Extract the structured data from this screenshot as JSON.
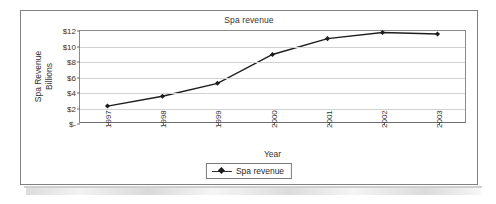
{
  "chart_data": {
    "type": "line",
    "title": "Spa revenue",
    "xlabel": "Year",
    "ylabel": "Spa Revenue Billions",
    "ylabel_lines": [
      "Spa Revenue",
      "Billions"
    ],
    "categories": [
      "1997",
      "1998",
      "1999",
      "2000",
      "2001",
      "2002",
      "2003"
    ],
    "series": [
      {
        "name": "Spa revenue",
        "values": [
          2.1,
          3.4,
          5.1,
          8.9,
          11.0,
          11.8,
          11.6
        ],
        "color": "#1d1d1d",
        "marker": "diamond"
      }
    ],
    "ylim": [
      0,
      12
    ],
    "ytick_values": [
      12,
      10,
      8,
      6,
      4,
      2,
      0
    ],
    "ytick_labels": [
      "$12",
      "$10",
      "$8",
      "$6",
      "$4",
      "$2",
      "$-"
    ],
    "grid": true,
    "grid_color": "#d2d2d2",
    "legend_position": "bottom",
    "legend_entries": [
      "Spa revenue"
    ],
    "plot_border_color": "#8a8a8a",
    "figure_border_color": "#808080",
    "background": "#ffffff",
    "text_color": "#333333"
  }
}
